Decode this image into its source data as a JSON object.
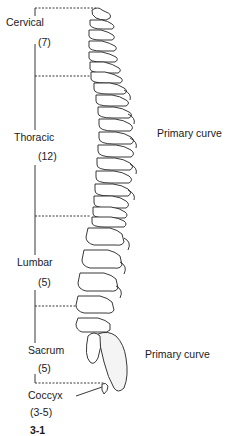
{
  "figure": {
    "regions": [
      {
        "name": "Cervical",
        "count": "(7)"
      },
      {
        "name": "Thoracic",
        "count": "(12)"
      },
      {
        "name": "Lumbar",
        "count": "(5)"
      },
      {
        "name": "Sacrum",
        "count": "(5)"
      },
      {
        "name": "Coccyx",
        "count": "(3-5)"
      }
    ],
    "curve_labels": {
      "thoracic": "Primary curve",
      "sacral": "Primary curve"
    },
    "caption_fragment": "3-1",
    "colors": {
      "ink": "#1a1a1a",
      "background": "#ffffff"
    }
  }
}
